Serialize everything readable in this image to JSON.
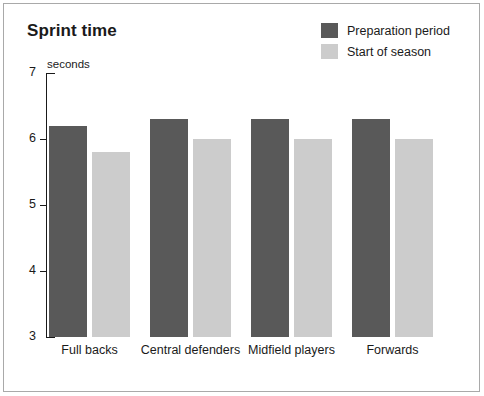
{
  "chart_data": {
    "type": "bar",
    "title": "Sprint time",
    "xlabel": "",
    "ylabel": "seconds",
    "ylim": [
      3,
      7
    ],
    "yticks": [
      3,
      4,
      5,
      6,
      7
    ],
    "ytick_labels": [
      "3",
      "4",
      "5",
      "6",
      "7"
    ],
    "grid": false,
    "legend_position": "top-right",
    "categories": [
      "Full backs",
      "Central defenders",
      "Midfield players",
      "Forwards"
    ],
    "series": [
      {
        "name": "Preparation period",
        "color": "#595959",
        "values": [
          6.2,
          6.3,
          6.3,
          6.3
        ]
      },
      {
        "name": "Start of season",
        "color": "#cccccc",
        "values": [
          5.8,
          6.0,
          6.0,
          6.0
        ]
      }
    ]
  },
  "figure": {
    "frame_color": "#a9a9a9",
    "background": "#ffffff",
    "axis_color": "#1a1a1a"
  }
}
